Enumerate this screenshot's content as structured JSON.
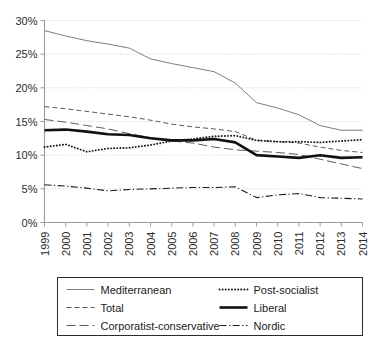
{
  "chart_data": {
    "type": "line",
    "title": "",
    "subtitle": "",
    "xlabel": "",
    "ylabel": "",
    "x": [
      1999,
      2000,
      2001,
      2002,
      2003,
      2004,
      2005,
      2006,
      2007,
      2008,
      2009,
      2010,
      2011,
      2012,
      2013,
      2014
    ],
    "categories": [
      "1999",
      "2000",
      "2001",
      "2002",
      "2003",
      "2004",
      "2005",
      "2006",
      "2007",
      "2008",
      "2009",
      "2010",
      "2011",
      "2012",
      "2013",
      "2014"
    ],
    "xlim": [
      1999,
      2014
    ],
    "ylim": [
      0,
      30
    ],
    "y_ticks": [
      0,
      5,
      10,
      15,
      20,
      25,
      30
    ],
    "y_tick_labels": [
      "0%",
      "5%",
      "10%",
      "15%",
      "20%",
      "25%",
      "30%"
    ],
    "grid": "horizontal-dotted",
    "legend_position": "bottom",
    "legend_columns": 2,
    "series": [
      {
        "name": "Mediterranean",
        "style": "solid-thin",
        "color": "#6e6e6e",
        "values": [
          28.5,
          27.7,
          27.0,
          26.5,
          25.9,
          24.3,
          23.6,
          23.0,
          22.4,
          20.7,
          17.8,
          17.0,
          16.0,
          14.4,
          13.7,
          13.7
        ]
      },
      {
        "name": "Total",
        "style": "short-dash",
        "color": "#4a4a4a",
        "values": [
          17.2,
          16.9,
          16.5,
          16.1,
          15.7,
          15.2,
          14.6,
          14.2,
          13.9,
          13.5,
          12.2,
          12.0,
          11.8,
          11.2,
          10.7,
          10.4
        ]
      },
      {
        "name": "Corporatist-conservative",
        "style": "long-dash",
        "color": "#4a4a4a",
        "values": [
          15.3,
          14.9,
          14.4,
          13.9,
          13.2,
          12.6,
          12.1,
          11.8,
          11.2,
          10.8,
          10.6,
          10.4,
          10.1,
          9.4,
          8.7,
          8.0
        ]
      },
      {
        "name": "Post-socialist",
        "style": "dotted",
        "color": "#1a1a1a",
        "values": [
          11.2,
          11.6,
          10.5,
          11.0,
          11.1,
          11.5,
          12.1,
          12.4,
          12.8,
          12.9,
          12.2,
          12.0,
          12.0,
          11.9,
          12.1,
          12.3
        ]
      },
      {
        "name": "Liberal",
        "style": "solid-thick",
        "color": "#111111",
        "values": [
          13.7,
          13.8,
          13.5,
          13.1,
          13.0,
          12.5,
          12.2,
          12.2,
          12.4,
          11.9,
          10.0,
          9.8,
          9.6,
          10.0,
          9.6,
          9.7
        ]
      },
      {
        "name": "Nordic",
        "style": "dash-dot",
        "color": "#1a1a1a",
        "values": [
          5.6,
          5.4,
          5.1,
          4.7,
          4.9,
          5.0,
          5.1,
          5.2,
          5.2,
          5.3,
          3.7,
          4.1,
          4.3,
          3.7,
          3.6,
          3.5
        ]
      }
    ]
  },
  "legend": {
    "entries": [
      {
        "label": "Mediterranean",
        "style": "solid-thin"
      },
      {
        "label": "Post-socialist",
        "style": "dotted"
      },
      {
        "label": "Total",
        "style": "short-dash"
      },
      {
        "label": "Liberal",
        "style": "solid-thick"
      },
      {
        "label": "Corporatist-conservative",
        "style": "long-dash"
      },
      {
        "label": "Nordic",
        "style": "dash-dot"
      }
    ]
  }
}
